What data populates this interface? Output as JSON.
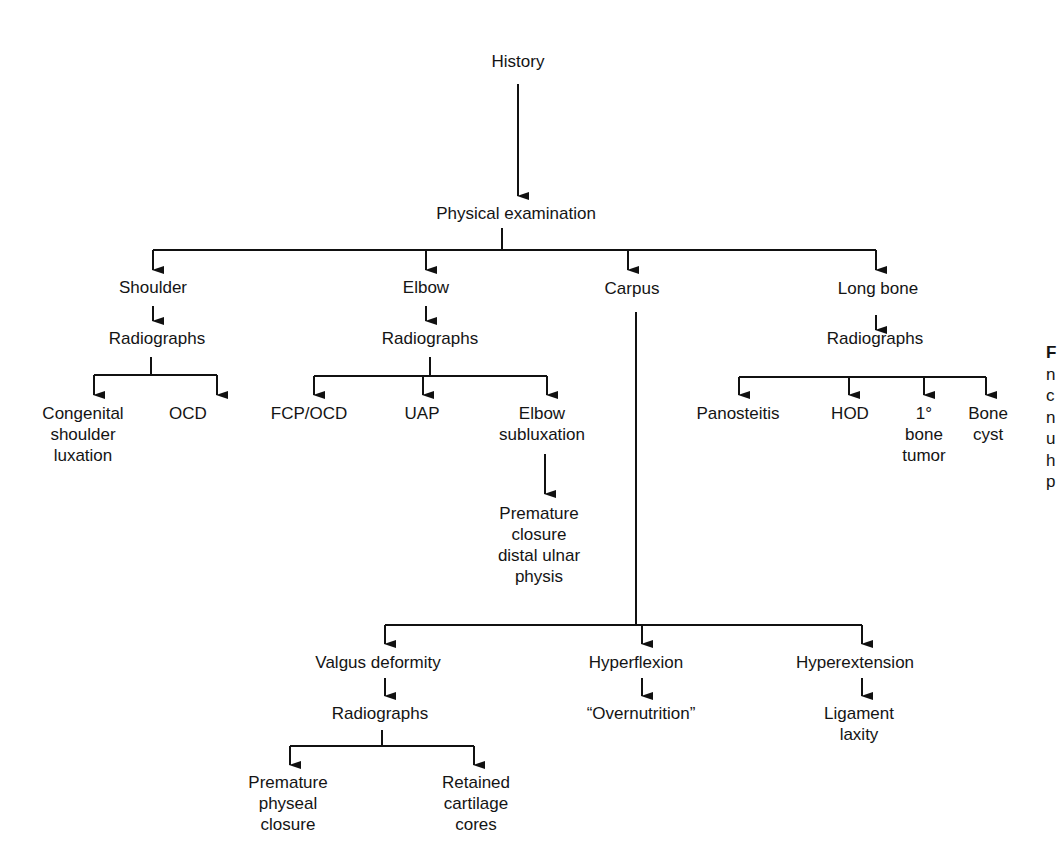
{
  "diagram": {
    "type": "flowchart",
    "nodes": {
      "history": {
        "lines": [
          "History"
        ]
      },
      "physical_exam": {
        "lines": [
          "Physical examination"
        ]
      },
      "shoulder": {
        "lines": [
          "Shoulder"
        ]
      },
      "shoulder_radiographs": {
        "lines": [
          "Radiographs"
        ]
      },
      "congenital_luxation": {
        "lines": [
          "Congenital",
          "shoulder",
          "luxation"
        ]
      },
      "shoulder_ocd": {
        "lines": [
          "OCD"
        ]
      },
      "elbow": {
        "lines": [
          "Elbow"
        ]
      },
      "elbow_radiographs": {
        "lines": [
          "Radiographs"
        ]
      },
      "fcp_ocd": {
        "lines": [
          "FCP/OCD"
        ]
      },
      "uap": {
        "lines": [
          "UAP"
        ]
      },
      "elbow_subluxation": {
        "lines": [
          "Elbow",
          "subluxation"
        ]
      },
      "premature_closure_ulnar": {
        "lines": [
          "Premature",
          "closure",
          "distal ulnar",
          "physis"
        ]
      },
      "carpus": {
        "lines": [
          "Carpus"
        ]
      },
      "valgus": {
        "lines": [
          "Valgus deformity"
        ]
      },
      "valgus_radiographs": {
        "lines": [
          "Radiographs"
        ]
      },
      "premature_physeal": {
        "lines": [
          "Premature",
          "physeal",
          "closure"
        ]
      },
      "retained_cartilage": {
        "lines": [
          "Retained",
          "cartilage",
          "cores"
        ]
      },
      "hyperflexion": {
        "lines": [
          "Hyperflexion"
        ]
      },
      "overnutrition": {
        "lines": [
          "“Overnutrition”"
        ]
      },
      "hyperextension": {
        "lines": [
          "Hyperextension"
        ]
      },
      "ligament_laxity": {
        "lines": [
          "Ligament",
          "laxity"
        ]
      },
      "long_bone": {
        "lines": [
          "Long bone"
        ]
      },
      "longbone_radiographs": {
        "lines": [
          "Radiographs"
        ]
      },
      "panosteitis": {
        "lines": [
          "Panosteitis"
        ]
      },
      "hod": {
        "lines": [
          "HOD"
        ]
      },
      "bone_tumor": {
        "lines": [
          "1°",
          "bone",
          "tumor"
        ]
      },
      "bone_cyst": {
        "lines": [
          "Bone",
          "cyst"
        ]
      }
    },
    "edges": [
      [
        "history",
        "physical_exam"
      ],
      [
        "physical_exam",
        "shoulder"
      ],
      [
        "physical_exam",
        "elbow"
      ],
      [
        "physical_exam",
        "carpus"
      ],
      [
        "physical_exam",
        "long_bone"
      ],
      [
        "shoulder",
        "shoulder_radiographs"
      ],
      [
        "shoulder_radiographs",
        "congenital_luxation"
      ],
      [
        "shoulder_radiographs",
        "shoulder_ocd"
      ],
      [
        "elbow",
        "elbow_radiographs"
      ],
      [
        "elbow_radiographs",
        "fcp_ocd"
      ],
      [
        "elbow_radiographs",
        "uap"
      ],
      [
        "elbow_radiographs",
        "elbow_subluxation"
      ],
      [
        "elbow_subluxation",
        "premature_closure_ulnar"
      ],
      [
        "carpus",
        "valgus"
      ],
      [
        "carpus",
        "hyperflexion"
      ],
      [
        "carpus",
        "hyperextension"
      ],
      [
        "valgus",
        "valgus_radiographs"
      ],
      [
        "valgus_radiographs",
        "premature_physeal"
      ],
      [
        "valgus_radiographs",
        "retained_cartilage"
      ],
      [
        "hyperflexion",
        "overnutrition"
      ],
      [
        "hyperextension",
        "ligament_laxity"
      ],
      [
        "long_bone",
        "longbone_radiographs"
      ],
      [
        "longbone_radiographs",
        "panosteitis"
      ],
      [
        "longbone_radiographs",
        "hod"
      ],
      [
        "longbone_radiographs",
        "bone_tumor"
      ],
      [
        "longbone_radiographs",
        "bone_cyst"
      ]
    ],
    "line_color": "#111111",
    "background": "#ffffff"
  },
  "caption_fragment": {
    "lines": [
      "F",
      "n",
      "c",
      "n",
      "u",
      "h",
      "p"
    ]
  }
}
